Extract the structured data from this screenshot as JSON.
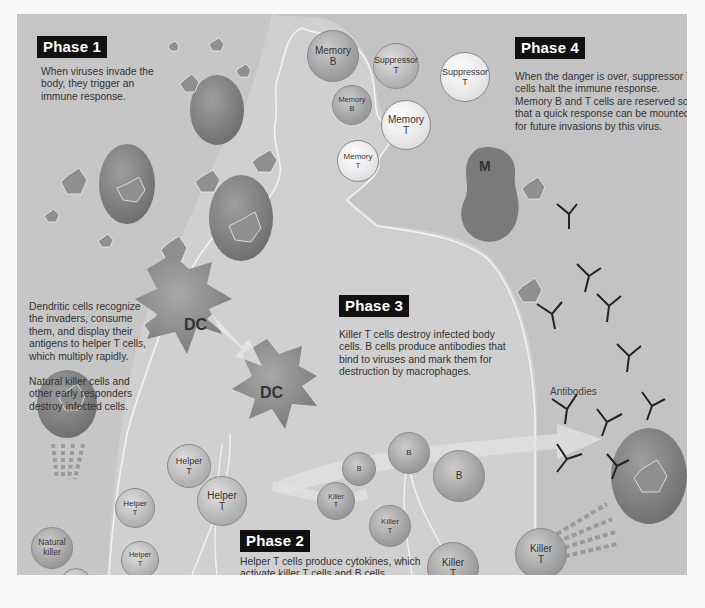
{
  "diagram": {
    "style": "grayscale illustration",
    "colors": {
      "panel_bg": "#c3c3c3",
      "body_silhouette": "#d3d3d3",
      "outline": "#f4f4f4",
      "phase_label_bg": "#111111",
      "phase_label_text": "#ffffff",
      "text": "#333333"
    }
  },
  "phases": [
    {
      "label": "Phase 1",
      "text": "When viruses invade the body, they trigger an immune response."
    },
    {
      "label": "Phase 2",
      "text": "Helper T cells produce cytokines, which activate killer T cells and B cells."
    },
    {
      "label": "Phase 3",
      "text": "Killer T cells destroy infected body cells. B cells produce antibodies that bind to viruses and mark them for destruction by macrophages."
    },
    {
      "label": "Phase 4",
      "text": "When the danger is over, suppressor T cells halt the immune response. Memory B and T cells are reserved so that a quick response can be mounted for future invasions by this virus."
    }
  ],
  "side_notes": [
    {
      "text": "Dendritic cells recognize the invaders, consume them, and display their antigens to helper T cells, which multiply rapidly."
    },
    {
      "text": "Natural killer cells and other early responders destroy infected cells."
    }
  ],
  "cells": {
    "memory_b_1": {
      "line1": "Memory",
      "line2": "B"
    },
    "suppressor_1": {
      "line1": "Suppressor",
      "line2": "T"
    },
    "suppressor_2": {
      "line1": "Suppressor",
      "line2": "T"
    },
    "memory_b_2": {
      "line1": "Memory",
      "line2": "B"
    },
    "memory_t_1": {
      "line1": "Memory",
      "line2": "T"
    },
    "memory_t_2": {
      "line1": "Memory",
      "line2": "T"
    },
    "dc_1": "DC",
    "dc_2": "DC",
    "macrophage": "M",
    "helper_1": {
      "line1": "Helper",
      "line2": "T"
    },
    "helper_2": {
      "line1": "Helper",
      "line2": "T"
    },
    "helper_3": {
      "line1": "Helper",
      "line2": "T"
    },
    "helper_4": {
      "line1": "Helper",
      "line2": "T"
    },
    "helper_5": {
      "line1": "Helper",
      "line2": "T"
    },
    "helper_main": {
      "line1": "Helper",
      "line2": "T"
    },
    "natural_killer": {
      "line1": "Natural",
      "line2": "killer"
    },
    "b_small": "B",
    "b_mid": "B",
    "b_large": "B",
    "killer_1": {
      "line1": "Killer",
      "line2": "T"
    },
    "killer_2": {
      "line1": "Killer",
      "line2": "T"
    },
    "killer_3": {
      "line1": "Killer",
      "line2": "T"
    },
    "killer_4": {
      "line1": "Killer",
      "line2": "T"
    }
  },
  "labels": {
    "antibodies": "Antibodies"
  }
}
